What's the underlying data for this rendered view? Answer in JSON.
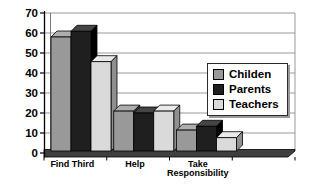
{
  "chart_data": {
    "type": "bar",
    "style": "3d-clustered",
    "title": "",
    "xlabel": "",
    "ylabel": "",
    "categories": [
      "Find Third",
      "Help",
      "Take Responsibility"
    ],
    "series": [
      {
        "name": "Childen",
        "values": [
          60,
          21,
          11
        ],
        "color": "#999999",
        "color_top": "#aeaeae",
        "color_side": "#4d4d4d"
      },
      {
        "name": "Parents",
        "values": [
          63,
          20,
          13
        ],
        "color": "#1f1f1f",
        "color_top": "#454545",
        "color_side": "#000000"
      },
      {
        "name": "Teachers",
        "values": [
          47,
          21,
          7
        ],
        "color": "#dadada",
        "color_top": "#eaeaea",
        "color_side": "#8f8f8f"
      }
    ],
    "ylim": [
      0,
      70
    ],
    "ytick_step": 10,
    "yticks": [
      0,
      10,
      20,
      30,
      40,
      50,
      60,
      70
    ],
    "grid": true,
    "legend_position": "right-overlay",
    "colors": {
      "gridline": "#999999",
      "axis": "#000000",
      "floor": "#3f3f3f",
      "wall_edge": "#777777",
      "background": "#ffffff",
      "legend_shadow": "#9a9a9a"
    }
  }
}
